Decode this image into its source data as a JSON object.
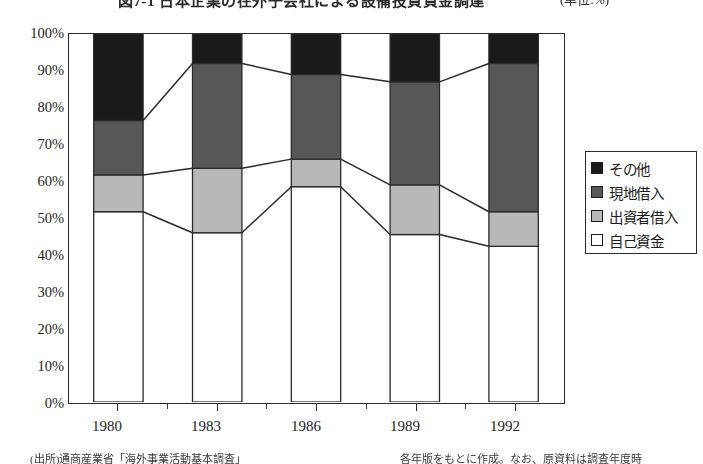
{
  "figure": {
    "title": "図7-1  日本企業の在外子会社による設備投資資金調達",
    "unit_note": "(単位:%)",
    "footnote_left": "(出所)通商産業省「海外事業活動基本調査」",
    "footnote_right": "各年版をもとに作成。なお、原資料は調査年度時"
  },
  "legend": {
    "position": "right",
    "items": [
      {
        "label": "その他",
        "color": "#1a1a1a",
        "swatch": "black-square-icon"
      },
      {
        "label": "現地借入",
        "color": "#575757",
        "swatch": "dark-gray-square-icon"
      },
      {
        "label": "出資者借入",
        "color": "#b8b8b8",
        "swatch": "light-gray-square-icon"
      },
      {
        "label": "自己資金",
        "color": "#ffffff",
        "swatch": "white-square-icon"
      }
    ]
  },
  "axes": {
    "y_ticks": [
      "0%",
      "10%",
      "20%",
      "30%",
      "40%",
      "50%",
      "60%",
      "70%",
      "80%",
      "90%",
      "100%"
    ],
    "x_ticks": [
      "1980",
      "1983",
      "1986",
      "1989",
      "1992"
    ]
  },
  "chart_data": {
    "type": "area",
    "title": "図7-1  日本企業の在外子会社による設備投資資金調達",
    "xlabel": "",
    "ylabel": "",
    "ylim": [
      0,
      100
    ],
    "grid": false,
    "legend_position": "right",
    "stacked": true,
    "percent": true,
    "categories": [
      "1980",
      "1983",
      "1986",
      "1989",
      "1992"
    ],
    "series": [
      {
        "name": "自己資金",
        "color": "#ffffff",
        "values": [
          51.7,
          46.0,
          58.5,
          45.5,
          42.3
        ]
      },
      {
        "name": "出資者借入",
        "color": "#b8b8b8",
        "values": [
          10.0,
          17.5,
          7.5,
          13.5,
          9.4
        ]
      },
      {
        "name": "現地借入",
        "color": "#575757",
        "values": [
          14.8,
          28.5,
          23.0,
          28.0,
          40.3
        ]
      },
      {
        "name": "その他",
        "color": "#1a1a1a",
        "values": [
          23.5,
          8.0,
          11.0,
          13.0,
          8.0
        ]
      }
    ],
    "cumulative_boundaries": {
      "self_funds_top": [
        51.7,
        46.0,
        58.5,
        45.5,
        42.3
      ],
      "plus_parent_loans_top": [
        61.7,
        63.5,
        66.0,
        59.0,
        51.7
      ],
      "plus_local_loans_top": [
        76.5,
        92.0,
        89.0,
        87.0,
        92.0
      ]
    }
  }
}
